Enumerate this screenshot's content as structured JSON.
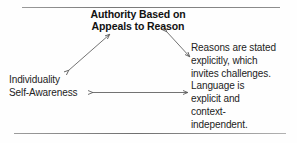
{
  "diagram": {
    "type": "triangular-relationship-diagram",
    "title_node": {
      "id": "authority",
      "lines": [
        "Authority Based on",
        "Appeals to Reason"
      ],
      "text": "Authority Based on\nAppeals to Reason",
      "bold": true
    },
    "left_node": {
      "id": "individuality",
      "lines": [
        "Individuality",
        "Self-Awareness"
      ],
      "text": "Individuality\nSelf-Awareness"
    },
    "right_node": {
      "id": "reasons",
      "lines": [
        "Reasons are stated",
        "explicitly, which",
        "invites challenges.",
        "Language is",
        "explicit and",
        "context-",
        "independent."
      ],
      "text": "Reasons are stated\nexplicitly, which\ninvites challenges.\nLanguage is\nexplicit and\ncontext-\nindependent."
    },
    "connectors": [
      {
        "id": "left-diagonal",
        "from": "individuality",
        "to": "authority",
        "style": "double-headed-arrow",
        "orientation": "diagonal-up-right"
      },
      {
        "id": "right-diagonal",
        "from": "authority",
        "to": "reasons",
        "style": "double-headed-arrow",
        "orientation": "diagonal-down-right"
      },
      {
        "id": "bottom-horizontal",
        "from": "individuality",
        "to": "reasons",
        "style": "double-headed-arrow",
        "orientation": "horizontal"
      }
    ],
    "rules": [
      {
        "id": "rule-top",
        "position": "top"
      },
      {
        "id": "rule-bottom",
        "position": "bottom"
      }
    ],
    "colors": {
      "ink": "#1d1d1d",
      "arrow": "#555555",
      "rule": "#8a8a8a",
      "background": "#fefefe"
    }
  }
}
